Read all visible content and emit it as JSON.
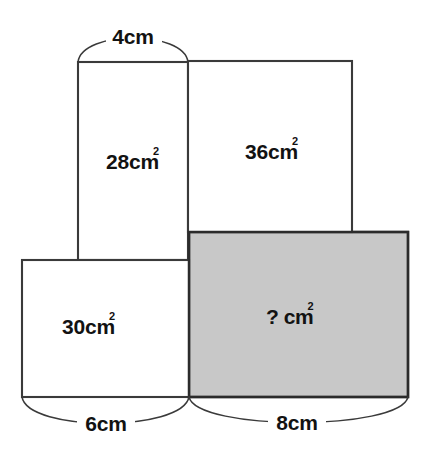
{
  "figure": {
    "type": "geometry-diagram",
    "background_color": "#ffffff",
    "stroke_color": "#3a3a3a",
    "shaded_fill_color": "#c8c8c8"
  },
  "rectangles": [
    {
      "id": "top-left",
      "area_value": "28",
      "area_unit": "cm",
      "area_exponent": "2",
      "area_label": "28cm²",
      "filled": false,
      "fill_color": "#ffffff",
      "x": 78,
      "y": 62,
      "width": 110,
      "height": 198
    },
    {
      "id": "top-right",
      "area_value": "36",
      "area_unit": "cm",
      "area_exponent": "2",
      "area_label": "36cm²",
      "filled": false,
      "fill_color": "#ffffff",
      "x": 188,
      "y": 61,
      "width": 164,
      "height": 171
    },
    {
      "id": "bottom-left",
      "area_value": "30",
      "area_unit": "cm",
      "area_exponent": "2",
      "area_label": "30cm²",
      "filled": false,
      "fill_color": "#ffffff",
      "x": 22,
      "y": 260,
      "width": 167,
      "height": 137
    },
    {
      "id": "bottom-right-shaded",
      "area_value": "?",
      "area_unit": "cm",
      "area_exponent": "2",
      "area_label": "? cm²",
      "filled": true,
      "fill_color": "#c8c8c8",
      "x": 189,
      "y": 232,
      "width": 219,
      "height": 165
    }
  ],
  "labels": {
    "area_top_left_num": "28",
    "area_top_left_unit": "cm",
    "area_top_left_sup": "2",
    "area_top_right_num": "36",
    "area_top_right_unit": "cm",
    "area_top_right_sup": "2",
    "area_bottom_left_num": "30",
    "area_bottom_left_unit": "cm",
    "area_bottom_left_sup": "2",
    "area_shaded_num": "?",
    "area_shaded_unit": "cm",
    "area_shaded_sup": "2"
  },
  "dimensions": [
    {
      "id": "top-width",
      "text": "4cm",
      "value": "4",
      "unit": "cm",
      "position": "top",
      "spans": "top-left rectangle width",
      "from_x": 78,
      "to_x": 188
    },
    {
      "id": "bottom-left-width",
      "text": "6cm",
      "value": "6",
      "unit": "cm",
      "position": "bottom",
      "spans": "bottom-left rectangle width",
      "from_x": 22,
      "to_x": 189
    },
    {
      "id": "bottom-right-width",
      "text": "8cm",
      "value": "8",
      "unit": "cm",
      "position": "bottom",
      "spans": "shaded rectangle width",
      "from_x": 189,
      "to_x": 408
    }
  ]
}
